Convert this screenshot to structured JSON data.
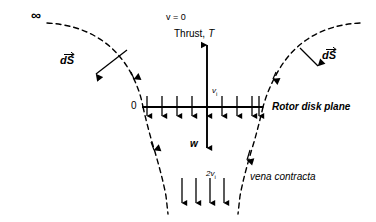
{
  "diagram": {
    "labels": {
      "infinity": "∞",
      "v_zero": "v = 0",
      "thrust": "Thrust,",
      "thrust_symbol": "T",
      "ds_left": "dS",
      "ds_right": "dS",
      "origin": "0",
      "induced_velocity": "v",
      "induced_velocity_sub": "i",
      "rotor_disk_plane": "Rotor disk plane",
      "weight": "w",
      "far_wake_velocity": "2v",
      "far_wake_velocity_sub": "i",
      "vena_contracta": "vena contracta"
    },
    "colors": {
      "stroke": "#000000",
      "background": "#ffffff"
    },
    "geometry": {
      "disk_line_y": 107,
      "disk_line_x_start": 142,
      "disk_line_x_end": 262,
      "axis_x": 207,
      "thrust_arrow_top_y": 46,
      "weight_arrow_bottom_y": 148,
      "disk_arrow_count": 9,
      "wake_arrow_count": 4,
      "wake_arrow_top_y": 178,
      "wake_arrow_bottom_y": 205
    }
  }
}
